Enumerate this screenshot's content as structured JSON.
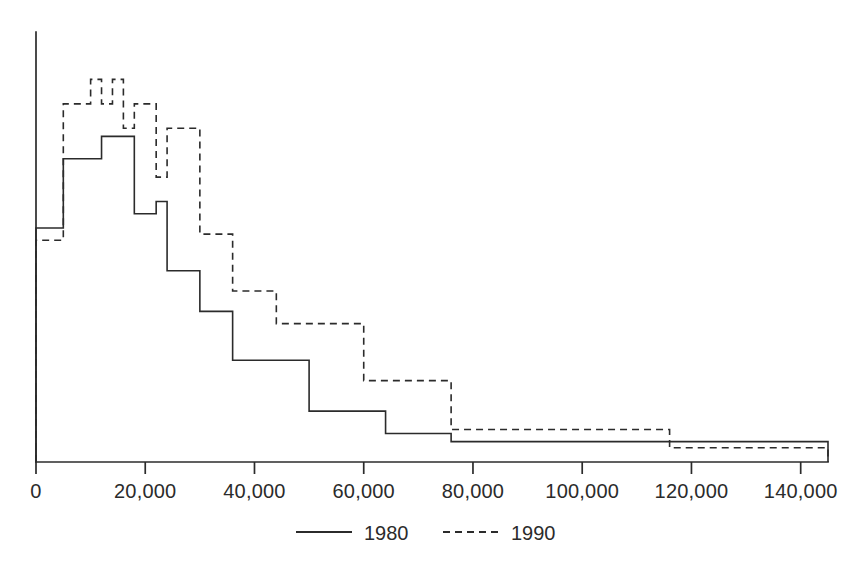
{
  "chart_data": {
    "type": "line",
    "subtype": "step-histogram",
    "title": "",
    "subtitle": "",
    "xlabel": "",
    "ylabel": "",
    "xlim": [
      0,
      145000
    ],
    "ylim": [
      0,
      1.0
    ],
    "grid": false,
    "legend_position": "bottom-center",
    "xticks": [
      0,
      20000,
      40000,
      60000,
      80000,
      100000,
      120000,
      140000
    ],
    "xticklabels": [
      "0",
      "20,000",
      "40,000",
      "60,000",
      "80,000",
      "100,000",
      "120,000",
      "140,000"
    ],
    "yticks": [],
    "yticklabels": [],
    "series": [
      {
        "name": "1980",
        "style": "solid",
        "color": "#2b2b2b",
        "bin_edges": [
          0,
          2000,
          5000,
          8000,
          10000,
          12000,
          14000,
          16000,
          18000,
          20000,
          22000,
          24000,
          26000,
          30000,
          36000,
          44000,
          50000,
          60000,
          64000,
          76000,
          145000
        ],
        "values": [
          0.575,
          0.575,
          0.745,
          0.745,
          0.745,
          0.8,
          0.8,
          0.8,
          0.61,
          0.61,
          0.64,
          0.47,
          0.47,
          0.37,
          0.25,
          0.25,
          0.125,
          0.125,
          0.07,
          0.05,
          0.0
        ]
      },
      {
        "name": "1990",
        "style": "dashed",
        "color": "#2b2b2b",
        "bin_edges": [
          0,
          2000,
          5000,
          8000,
          10000,
          12000,
          14000,
          16000,
          18000,
          20000,
          22000,
          24000,
          26000,
          30000,
          36000,
          44000,
          50000,
          60000,
          64000,
          76000,
          116000,
          145000
        ],
        "values": [
          0.545,
          0.545,
          0.88,
          0.88,
          0.94,
          0.88,
          0.94,
          0.82,
          0.88,
          0.88,
          0.7,
          0.82,
          0.82,
          0.56,
          0.42,
          0.34,
          0.34,
          0.2,
          0.2,
          0.08,
          0.035,
          0.0
        ]
      }
    ],
    "legend": [
      {
        "label": "1980",
        "style": "solid"
      },
      {
        "label": "1990",
        "style": "dashed"
      }
    ],
    "colors": {
      "axis": "#2b2b2b",
      "series_1980": "#2b2b2b",
      "series_1990": "#2b2b2b",
      "background": "#ffffff"
    }
  }
}
